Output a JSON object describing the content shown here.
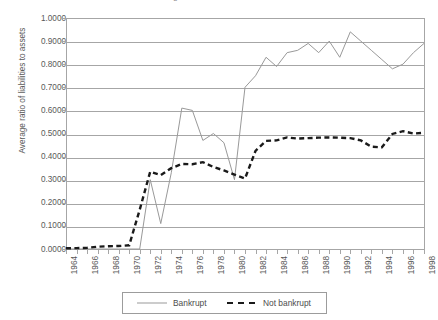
{
  "chart_data": {
    "type": "line",
    "title": "Average ratio of liabilities to assets",
    "xlabel": "",
    "ylabel": "Average ratio of liabilities to assets",
    "xlim": [
      1964,
      1998
    ],
    "ylim": [
      0.0,
      1.0
    ],
    "grid": true,
    "legend_position": "bottom",
    "x": [
      1964,
      1965,
      1966,
      1967,
      1968,
      1969,
      1970,
      1971,
      1972,
      1973,
      1974,
      1975,
      1976,
      1977,
      1978,
      1979,
      1980,
      1981,
      1982,
      1983,
      1984,
      1985,
      1986,
      1987,
      1988,
      1989,
      1990,
      1991,
      1992,
      1993,
      1994,
      1995,
      1996,
      1997,
      1998
    ],
    "x_tick_labels": [
      "1964",
      "1966",
      "1968",
      "1970",
      "1972",
      "1974",
      "1976",
      "1978",
      "1980",
      "1982",
      "1984",
      "1986",
      "1988",
      "1990",
      "1992",
      "1994",
      "1996",
      "1998"
    ],
    "y_tick_labels": [
      "1.0000",
      "0.9000",
      "0.8000",
      "0.7000",
      "0.6000",
      "0.5000",
      "0.4000",
      "0.3000",
      "0.2000",
      "0.1000",
      "0.0000"
    ],
    "y_ticks": [
      1.0,
      0.9,
      0.8,
      0.7,
      0.6,
      0.5,
      0.4,
      0.3,
      0.2,
      0.1,
      0.0
    ],
    "series": [
      {
        "name": "Bankrupt",
        "style": "solid",
        "color": "#999999",
        "values": [
          0.0,
          0.0,
          0.0,
          0.0,
          0.0,
          0.0,
          0.0,
          0.0,
          0.3,
          0.11,
          0.33,
          0.61,
          0.6,
          0.47,
          0.5,
          0.46,
          0.3,
          0.7,
          0.75,
          0.83,
          0.79,
          0.85,
          0.86,
          0.89,
          0.85,
          0.9,
          0.83,
          0.94,
          0.9,
          0.86,
          0.82,
          0.78,
          0.8,
          0.85,
          0.89
        ]
      },
      {
        "name": "Not bankrupt",
        "style": "dashed",
        "color": "#1a1a1a",
        "values": [
          0.003,
          0.004,
          0.005,
          0.01,
          0.012,
          0.013,
          0.016,
          0.17,
          0.335,
          0.32,
          0.35,
          0.368,
          0.367,
          0.376,
          0.355,
          0.34,
          0.322,
          0.305,
          0.425,
          0.468,
          0.47,
          0.483,
          0.478,
          0.48,
          0.482,
          0.483,
          0.482,
          0.48,
          0.47,
          0.443,
          0.44,
          0.498,
          0.51,
          0.5,
          0.503
        ]
      }
    ]
  },
  "legend": {
    "entries": [
      {
        "label": "Bankrupt"
      },
      {
        "label": "Not bankrupt"
      }
    ]
  }
}
